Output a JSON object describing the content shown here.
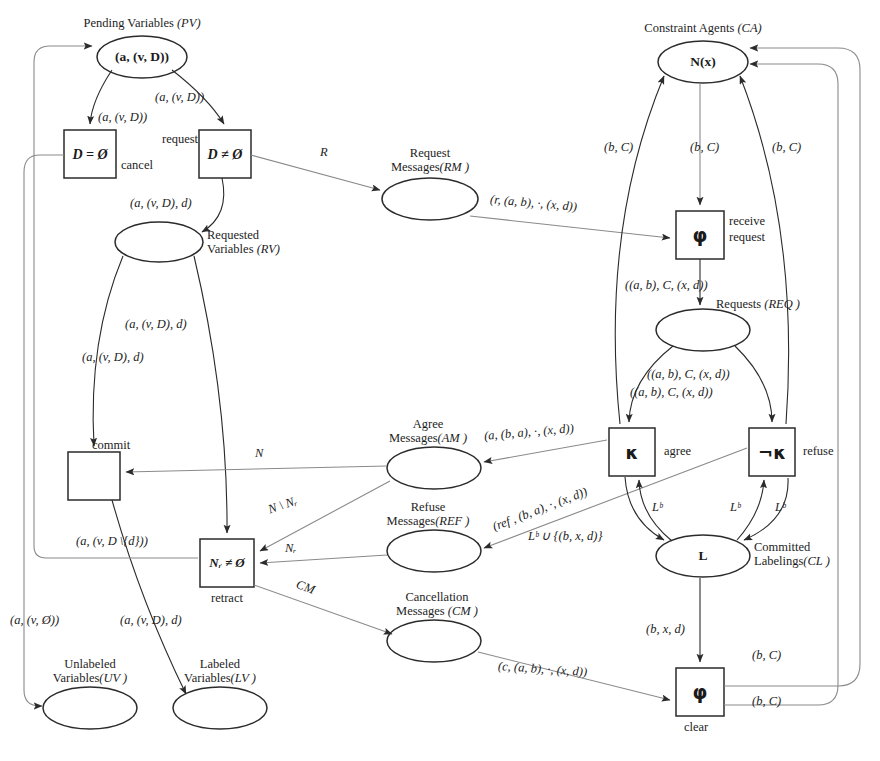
{
  "diagram": {
    "stroke_color": "#2b2b2b",
    "thin_stroke_color": "#8a8a8a",
    "places": [
      {
        "id": "PV",
        "label_line1": "Pending Variables",
        "label_abbr": "(PV)",
        "token": "(a, (v, D))",
        "cx": 142,
        "cy": 57,
        "rx": 45,
        "ry": 21
      },
      {
        "id": "RV",
        "label_line1": "Requested",
        "label_line2": "Variables",
        "label_abbr": "(RV)",
        "token": "",
        "cx": 159,
        "cy": 242,
        "rx": 44,
        "ry": 20
      },
      {
        "id": "RM",
        "label_line1": "Request",
        "label_line2": "Messages",
        "label_abbr": "(RM )",
        "token": "",
        "cx": 430,
        "cy": 199,
        "rx": 48,
        "ry": 21
      },
      {
        "id": "CA",
        "label_line1": "Constraint Agents",
        "label_abbr": "(CA)",
        "token": "N(x)",
        "cx": 703,
        "cy": 62,
        "rx": 45,
        "ry": 21
      },
      {
        "id": "REQ",
        "label_line1": "Requests",
        "label_abbr": "(REQ )",
        "token": "",
        "cx": 703,
        "cy": 330,
        "rx": 47,
        "ry": 21
      },
      {
        "id": "AM",
        "label_line1": "Agree",
        "label_line2": "Messages",
        "label_abbr": "(AM )",
        "token": "",
        "cx": 434,
        "cy": 468,
        "rx": 47,
        "ry": 21
      },
      {
        "id": "REF",
        "label_line1": "Refuse",
        "label_line2": "Messages",
        "label_abbr": "(REF )",
        "token": "",
        "cx": 434,
        "cy": 551,
        "rx": 47,
        "ry": 21
      },
      {
        "id": "CM",
        "label_line1": "Cancellation",
        "label_line2": "Messages",
        "label_abbr": "(CM )",
        "token": "",
        "cx": 434,
        "cy": 641,
        "rx": 47,
        "ry": 21
      },
      {
        "id": "CL",
        "label_line1": "Committed",
        "label_line2": "Labelings",
        "label_abbr": "(CL )",
        "token": "L",
        "cx": 703,
        "cy": 556,
        "rx": 47,
        "ry": 21
      },
      {
        "id": "UV",
        "label_line1": "Unlabeled",
        "label_line2": "Variables",
        "label_abbr": "(UV )",
        "token": "",
        "cx": 90,
        "cy": 708,
        "rx": 47,
        "ry": 21
      },
      {
        "id": "LV",
        "label_line1": "Labeled",
        "label_line2": "Variables",
        "label_abbr": "(LV )",
        "token": "",
        "cx": 220,
        "cy": 708,
        "rx": 47,
        "ry": 21
      }
    ],
    "transitions": [
      {
        "id": "cancel",
        "guard": "D = Ø",
        "name": "cancel",
        "x": 64,
        "y": 130,
        "w": 52,
        "h": 48,
        "name_pos": "right-below"
      },
      {
        "id": "request",
        "guard": "D ≠ Ø",
        "name": "request",
        "x": 199,
        "y": 130,
        "w": 52,
        "h": 48,
        "name_pos": "left-above"
      },
      {
        "id": "receive_request",
        "guard": "φ",
        "name": "receive\nrequest",
        "x": 676,
        "y": 211,
        "w": 48,
        "h": 48,
        "name_pos": "right"
      },
      {
        "id": "agree",
        "guard": "κ",
        "name": "agree",
        "x": 609,
        "y": 428,
        "w": 46,
        "h": 48,
        "name_pos": "right"
      },
      {
        "id": "refuse",
        "guard": "¬κ",
        "name": "refuse",
        "x": 749,
        "y": 428,
        "w": 46,
        "h": 48,
        "name_pos": "right"
      },
      {
        "id": "commit",
        "guard": "",
        "name": "commit",
        "x": 68,
        "y": 452,
        "w": 52,
        "h": 48,
        "name_pos": "top"
      },
      {
        "id": "retract",
        "guard": "Nᵣ ≠ Ø",
        "name": "retract",
        "x": 200,
        "y": 539,
        "w": 54,
        "h": 48,
        "name_pos": "below"
      },
      {
        "id": "clear",
        "guard": "φ",
        "name": "clear",
        "x": 676,
        "y": 668,
        "w": 48,
        "h": 48,
        "name_pos": "below"
      }
    ],
    "arc_labels": [
      {
        "text": "(a, (v, D))",
        "x": 98,
        "y": 110,
        "italic": true
      },
      {
        "text": "(a, (v, D))",
        "x": 155,
        "y": 90,
        "italic": true
      },
      {
        "text": "request",
        "x": 162,
        "y": 132,
        "italic": false
      },
      {
        "text": "cancel",
        "x": 121,
        "y": 158,
        "italic": false
      },
      {
        "text": "R",
        "x": 320,
        "y": 145,
        "italic": true
      },
      {
        "text": "(a, (v, D), d)",
        "x": 130,
        "y": 196,
        "italic": true
      },
      {
        "text": "(a, (v, D), d)",
        "x": 125,
        "y": 317,
        "italic": true
      },
      {
        "text": "(a, (v, D), d)",
        "x": 82,
        "y": 350,
        "italic": true
      },
      {
        "text": "commit",
        "x": 92,
        "y": 438,
        "italic": false
      },
      {
        "text": "N",
        "x": 255,
        "y": 446,
        "italic": true
      },
      {
        "text": "N \\ Nᵣ",
        "x": 272,
        "y": 503,
        "italic": true
      },
      {
        "text": "Nᵣ",
        "x": 285,
        "y": 541,
        "italic": true
      },
      {
        "text": "CM",
        "x": 300,
        "y": 585,
        "italic": true
      },
      {
        "text": "(a, (v, D \\{d}))",
        "x": 76,
        "y": 534,
        "italic": true
      },
      {
        "text": "retract",
        "x": 211,
        "y": 591,
        "italic": false
      },
      {
        "text": "(a, (v, Ø))",
        "x": 10,
        "y": 613,
        "italic": true
      },
      {
        "text": "(a, (v, D), d)",
        "x": 120,
        "y": 613,
        "italic": true
      },
      {
        "text": "(b, C)",
        "x": 604,
        "y": 140,
        "italic": true
      },
      {
        "text": "(b, C)",
        "x": 690,
        "y": 140,
        "italic": true
      },
      {
        "text": "(b, C)",
        "x": 772,
        "y": 140,
        "italic": true
      },
      {
        "text": "(r, (a, b), ·, (x, d))",
        "x": 490,
        "y": 203,
        "italic": true
      },
      {
        "text": "((a, b), C, (x, d))",
        "x": 625,
        "y": 285,
        "italic": true
      },
      {
        "text": "((a, b), C, (x, d))",
        "x": 647,
        "y": 373,
        "italic": true
      },
      {
        "text": "((a, b), C, (x, d))",
        "x": 630,
        "y": 390,
        "italic": true
      },
      {
        "text": "(a, (b, a), ·, (x, d))",
        "x": 487,
        "y": 431,
        "italic": true
      },
      {
        "text": "agree",
        "x": 664,
        "y": 444,
        "italic": false
      },
      {
        "text": "refuse",
        "x": 803,
        "y": 444,
        "italic": false
      },
      {
        "text": "(ref , (b, a), ·, (x, d))",
        "x": 500,
        "y": 490,
        "italic": true,
        "rotate": -20
      },
      {
        "text": "Lᵇ",
        "x": 652,
        "y": 507,
        "italic": true
      },
      {
        "text": "Lᵇ",
        "x": 730,
        "y": 507,
        "italic": true
      },
      {
        "text": "Lᵇ",
        "x": 775,
        "y": 507,
        "italic": true
      },
      {
        "text": "Lᵇ ∪ {(b, x, d)}",
        "x": 530,
        "y": 532,
        "italic": true
      },
      {
        "text": "(b, x, d)",
        "x": 646,
        "y": 630,
        "italic": true
      },
      {
        "text": "(c, (a, b), ·, (x, d))",
        "x": 500,
        "y": 669,
        "italic": true
      },
      {
        "text": "(b, C)",
        "x": 755,
        "y": 655,
        "italic": true
      },
      {
        "text": "(b, C)",
        "x": 755,
        "y": 700,
        "italic": true
      },
      {
        "text": "receive",
        "x": 729,
        "y": 220,
        "italic": false
      },
      {
        "text": "request",
        "x": 729,
        "y": 236,
        "italic": false
      },
      {
        "text": "clear",
        "x": 686,
        "y": 722,
        "italic": false
      }
    ],
    "tokens": {
      "PV": "(a, (v, D))",
      "CA": "N(x)",
      "CL": "L"
    }
  }
}
